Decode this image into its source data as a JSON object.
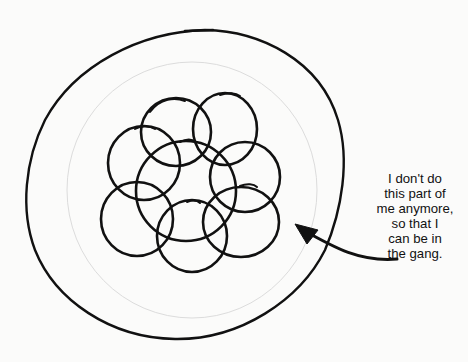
{
  "diagram": {
    "elements": {
      "outer_circle": "self",
      "loop_cluster": {
        "count": 8,
        "meaning": "the gang"
      },
      "arrow": {
        "target": "empty region inside outer circle",
        "from": "caption"
      }
    },
    "caption": {
      "lines": [
        "I don't do",
        "this part of",
        "me anymore,",
        "so that I",
        "can be in",
        "the gang."
      ]
    },
    "colors": {
      "ink": "#111111",
      "background": "#fbfbfa",
      "faint_circle": "#dcdcdc"
    }
  }
}
